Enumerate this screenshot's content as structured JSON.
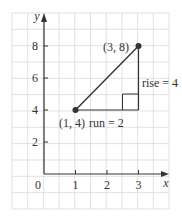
{
  "chart_data": {
    "type": "line",
    "title": "",
    "xlabel": "x",
    "ylabel": "y",
    "xlim": [
      -1,
      4
    ],
    "ylim": [
      -1,
      10
    ],
    "grid": true,
    "x_ticks": [
      1,
      2,
      3
    ],
    "x_tick_labels": [
      "1",
      "2",
      "3"
    ],
    "y_ticks": [
      2,
      4,
      6,
      8
    ],
    "y_tick_labels": [
      "2",
      "4",
      "6",
      "8"
    ],
    "origin_label": "0",
    "series": [
      {
        "name": "segment",
        "points": [
          {
            "x": 1,
            "y": 4
          },
          {
            "x": 3,
            "y": 8
          }
        ]
      }
    ],
    "points": [
      {
        "x": 1,
        "y": 4,
        "label": "(1, 4)"
      },
      {
        "x": 3,
        "y": 8,
        "label": "(3, 8)"
      }
    ],
    "annotations": [
      {
        "text": "run = 2",
        "from": {
          "x": 1,
          "y": 4
        },
        "to": {
          "x": 3,
          "y": 4
        }
      },
      {
        "text": "rise = 4",
        "from": {
          "x": 3,
          "y": 4
        },
        "to": {
          "x": 3,
          "y": 8
        }
      }
    ],
    "slope": 2
  },
  "colors": {
    "grid": "#d9d9d9",
    "axis": "#333333",
    "line": "#333333",
    "text": "#333333",
    "background": "#ffffff"
  }
}
